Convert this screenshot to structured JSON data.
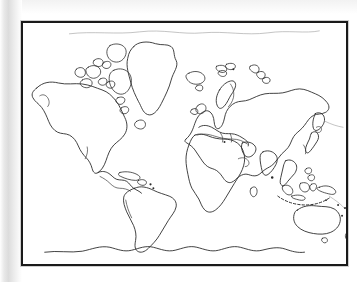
{
  "document": {
    "type": "blank-outline-world-map",
    "title": "Blank World Map Outline",
    "description": "Black-and-white photocopied outline map of the world showing continental coastlines with no labels, borders, graticule or legend.",
    "orientation": "landscape",
    "has_labels": false,
    "has_graticule": false,
    "has_legend": false,
    "has_scale_bar": false,
    "has_compass_rose": false,
    "projection_appearance": "cylindrical-equirectangular-like"
  },
  "colors": {
    "page_background": "#ffffff",
    "map_background": "#ffffff",
    "frame_border": "#1a1a1a",
    "coastline_stroke": "#2b2b2b",
    "faint_stroke": "#9a9a9a",
    "scan_shadow": "#dcdcdc"
  },
  "frame": {
    "x": 21,
    "y": 21,
    "width": 327,
    "height": 245,
    "border_width_px": 2
  },
  "landmasses": [
    {
      "id": "north-america",
      "name": "North America",
      "visible": true
    },
    {
      "id": "greenland",
      "name": "Greenland",
      "visible": true
    },
    {
      "id": "canadian-arctic-archipelago",
      "name": "Canadian Arctic Archipelago",
      "visible": true
    },
    {
      "id": "south-america",
      "name": "South America",
      "visible": true
    },
    {
      "id": "central-america",
      "name": "Central America",
      "visible": true
    },
    {
      "id": "caribbean-islands",
      "name": "Caribbean Islands",
      "visible": true
    },
    {
      "id": "africa",
      "name": "Africa",
      "visible": true
    },
    {
      "id": "madagascar",
      "name": "Madagascar",
      "visible": true
    },
    {
      "id": "eurasia",
      "name": "Eurasia",
      "visible": true
    },
    {
      "id": "scandinavia",
      "name": "Scandinavia",
      "visible": true
    },
    {
      "id": "british-isles",
      "name": "British Isles",
      "visible": true
    },
    {
      "id": "iceland",
      "name": "Iceland",
      "visible": true
    },
    {
      "id": "svalbard",
      "name": "Svalbard",
      "visible": true
    },
    {
      "id": "novaya-zemlya",
      "name": "Novaya Zemlya",
      "visible": true
    },
    {
      "id": "kamchatka",
      "name": "Kamchatka Peninsula",
      "visible": true
    },
    {
      "id": "japan",
      "name": "Japan",
      "visible": true
    },
    {
      "id": "india",
      "name": "Indian Subcontinent",
      "visible": true
    },
    {
      "id": "sri-lanka",
      "name": "Sri Lanka",
      "visible": true
    },
    {
      "id": "indonesia",
      "name": "Indonesian Archipelago",
      "visible": true
    },
    {
      "id": "philippines",
      "name": "Philippines",
      "visible": true
    },
    {
      "id": "new-guinea",
      "name": "New Guinea",
      "visible": true
    },
    {
      "id": "australia",
      "name": "Australia",
      "visible": true
    },
    {
      "id": "tasmania",
      "name": "Tasmania",
      "visible": true
    },
    {
      "id": "new-zealand",
      "name": "New Zealand",
      "visible": true
    },
    {
      "id": "pacific-islands",
      "name": "Pacific Islands",
      "visible": true
    },
    {
      "id": "antarctica",
      "name": "Antarctica",
      "visible": true
    },
    {
      "id": "arctic-coast",
      "name": "Arctic Coast Line",
      "visible": true
    }
  ]
}
